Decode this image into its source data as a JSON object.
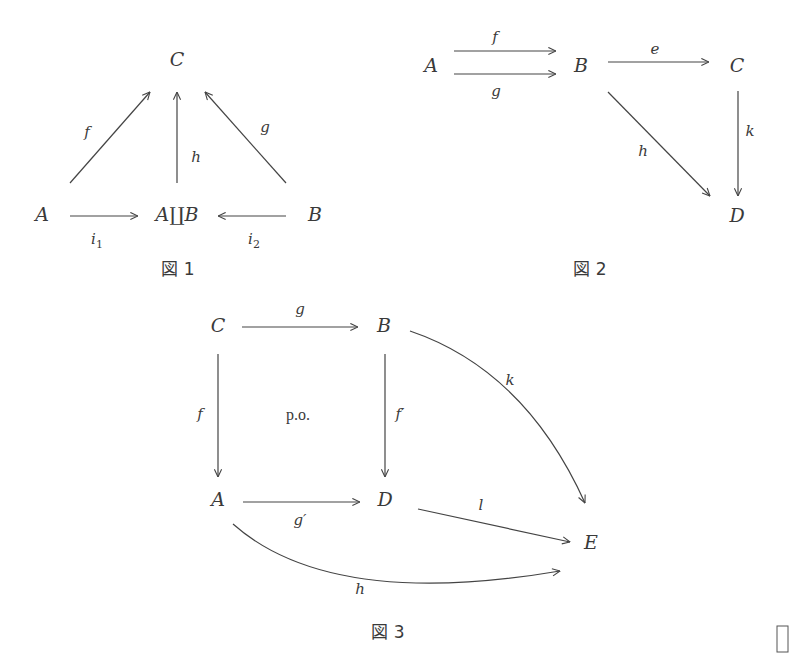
{
  "figures": [
    {
      "id": "fig1",
      "caption": "図 1",
      "caption_pos": [
        178,
        275
      ],
      "nodes": [
        {
          "id": "C",
          "label": "C",
          "x": 177,
          "y": 66
        },
        {
          "id": "A",
          "label": "A",
          "x": 42,
          "y": 221
        },
        {
          "id": "AuB",
          "label": "A∐B",
          "x": 177,
          "y": 221
        },
        {
          "id": "B",
          "label": "B",
          "x": 315,
          "y": 221
        }
      ],
      "arrows": [
        {
          "name": "f",
          "label": "f",
          "d": "M70,183 L150,92",
          "label_pos": [
            87,
            137
          ]
        },
        {
          "name": "h",
          "label": "h",
          "d": "M177,183 L177,92",
          "label_pos": [
            196,
            162
          ]
        },
        {
          "name": "g",
          "label": "g",
          "d": "M286,183 L205,92",
          "label_pos": [
            265,
            132
          ]
        },
        {
          "name": "i1",
          "label": "i",
          "sub": "1",
          "d": "M70,216 L138,216",
          "label_pos": [
            97,
            244
          ]
        },
        {
          "name": "i2",
          "label": "i",
          "sub": "2",
          "d": "M286,216 L218,216",
          "label_pos": [
            254,
            244
          ]
        }
      ]
    },
    {
      "id": "fig2",
      "caption": "図 2",
      "caption_pos": [
        590,
        275
      ],
      "nodes": [
        {
          "id": "A",
          "label": "A",
          "x": 431,
          "y": 72
        },
        {
          "id": "B",
          "label": "B",
          "x": 581,
          "y": 72
        },
        {
          "id": "C",
          "label": "C",
          "x": 737,
          "y": 72
        },
        {
          "id": "D",
          "label": "D",
          "x": 737,
          "y": 222
        }
      ],
      "arrows": [
        {
          "name": "f",
          "label": "f",
          "d": "M454,51 L556,51",
          "label_pos": [
            495,
            42
          ]
        },
        {
          "name": "g",
          "label": "g",
          "d": "M454,74 L556,74",
          "label_pos": [
            496,
            96
          ]
        },
        {
          "name": "e",
          "label": "e",
          "d": "M608,62 L709,62",
          "label_pos": [
            655,
            54
          ]
        },
        {
          "name": "h",
          "label": "h",
          "d": "M608,92 L710,196",
          "label_pos": [
            643,
            156
          ]
        },
        {
          "name": "k",
          "label": "k",
          "d": "M738,91 L738,196",
          "label_pos": [
            750,
            136
          ]
        }
      ]
    },
    {
      "id": "fig3",
      "caption": "図 3",
      "caption_pos": [
        388,
        638
      ],
      "po_label": "p.o.",
      "po_pos": [
        298,
        420
      ],
      "nodes": [
        {
          "id": "C",
          "label": "C",
          "x": 218,
          "y": 332
        },
        {
          "id": "B",
          "label": "B",
          "x": 384,
          "y": 332
        },
        {
          "id": "A",
          "label": "A",
          "x": 218,
          "y": 506
        },
        {
          "id": "D",
          "label": "D",
          "x": 385,
          "y": 506
        },
        {
          "id": "E",
          "label": "E",
          "x": 591,
          "y": 549
        }
      ],
      "arrows": [
        {
          "name": "g",
          "label": "g",
          "d": "M242,327 L358,327",
          "label_pos": [
            300,
            314
          ]
        },
        {
          "name": "f",
          "label": "f",
          "d": "M218,354 L218,477",
          "label_pos": [
            200,
            419
          ]
        },
        {
          "name": "f-prime",
          "label": "f′",
          "d": "M385,354 L385,477",
          "label_pos": [
            400,
            419
          ]
        },
        {
          "name": "g-prime",
          "label": "g′",
          "d": "M243,502 L360,502",
          "label_pos": [
            300,
            525
          ]
        },
        {
          "name": "k",
          "label": "k",
          "d": "M410,331 Q525,370 585,503",
          "label_pos": [
            510,
            385
          ]
        },
        {
          "name": "l",
          "label": "l",
          "d": "M418,509 L570,542",
          "label_pos": [
            481,
            510
          ]
        },
        {
          "name": "h",
          "label": "h",
          "d": "M233,524 Q330,610 560,571",
          "label_pos": [
            360,
            594
          ]
        }
      ]
    }
  ],
  "corner_box": {
    "x": 777,
    "y": 626,
    "w": 11,
    "h": 26
  }
}
